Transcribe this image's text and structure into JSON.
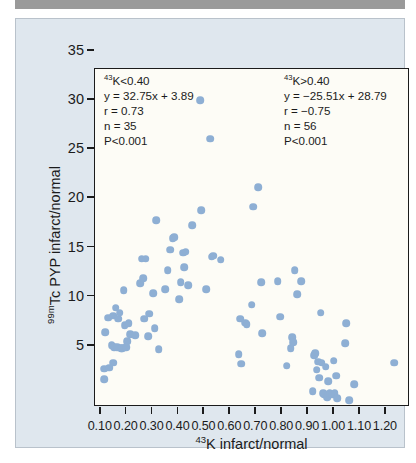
{
  "figure": {
    "background_color": "#dfe7ee",
    "plot_background_color": "#fdfcf6",
    "point_color": "#8eafd4",
    "axis_color": "#1b1b1b"
  },
  "annotations": {
    "left": {
      "header_sup": "43",
      "header_text": "K<0.40",
      "equation": "y = 32.75x + 3.89",
      "r": "r = 0.73",
      "n": "n = 35",
      "p": "P<0.001"
    },
    "right": {
      "header_sup": "43",
      "header_text": "K>0.40",
      "equation": "y = −25.51x + 28.79",
      "r": "r = −0.75",
      "n": "n = 56",
      "p": "P<0.001"
    }
  },
  "axes": {
    "x_title_sup": "43",
    "x_title_text": "K infarct/normal",
    "y_title_sup": "99m",
    "y_title_text": "Tc PYP infarct/normal"
  },
  "chart_data": {
    "type": "scatter",
    "title": "",
    "xlabel": "43K infarct/normal",
    "ylabel": "99mTc PYP infarct/normal",
    "xlim": [
      0.02,
      1.235
    ],
    "ylim": [
      0.6,
      35
    ],
    "xticks": [
      0.1,
      0.2,
      0.3,
      0.4,
      0.5,
      0.6,
      0.7,
      0.8,
      0.9,
      1.0,
      1.1,
      1.2
    ],
    "xticklabels": [
      "0.10",
      "0.20",
      "0.30",
      "0.40",
      "0.50",
      "0.60",
      "0.70",
      "0.80",
      "0.90",
      "1.00",
      "1.10",
      "1.20"
    ],
    "yticks": [
      5,
      10,
      15,
      20,
      25,
      30,
      35
    ],
    "yticklabels": [
      "5",
      "10",
      "15",
      "20",
      "25",
      "30",
      "35"
    ],
    "grid": false,
    "legend": "none",
    "regressions": [
      {
        "group": "43K<0.40",
        "slope": 32.75,
        "intercept": 3.89,
        "r": 0.73,
        "n": 35,
        "p": "<0.001"
      },
      {
        "group": "43K>0.40",
        "slope": -25.51,
        "intercept": 28.79,
        "r": -0.75,
        "n": 56,
        "p": "<0.001"
      }
    ],
    "points": [
      [
        0.055,
        3.4
      ],
      [
        0.055,
        4.5
      ],
      [
        0.06,
        8.2
      ],
      [
        0.07,
        9.7
      ],
      [
        0.075,
        4.6
      ],
      [
        0.085,
        6.9
      ],
      [
        0.09,
        9.9
      ],
      [
        0.09,
        5.1
      ],
      [
        0.095,
        6.7
      ],
      [
        0.1,
        10.7
      ],
      [
        0.105,
        6.7
      ],
      [
        0.11,
        9.6
      ],
      [
        0.115,
        10.2
      ],
      [
        0.12,
        6.6
      ],
      [
        0.125,
        6.6
      ],
      [
        0.13,
        12.5
      ],
      [
        0.135,
        8.9
      ],
      [
        0.14,
        6.7
      ],
      [
        0.145,
        7.3
      ],
      [
        0.15,
        9.1
      ],
      [
        0.155,
        8.0
      ],
      [
        0.175,
        7.9
      ],
      [
        0.195,
        13.2
      ],
      [
        0.2,
        15.7
      ],
      [
        0.205,
        13.7
      ],
      [
        0.21,
        9.6
      ],
      [
        0.215,
        15.7
      ],
      [
        0.225,
        7.8
      ],
      [
        0.23,
        10.1
      ],
      [
        0.245,
        12.2
      ],
      [
        0.25,
        8.6
      ],
      [
        0.255,
        19.6
      ],
      [
        0.265,
        6.5
      ],
      [
        0.29,
        12.6
      ],
      [
        0.3,
        14.5
      ],
      [
        0.31,
        16.6
      ],
      [
        0.32,
        17.8
      ],
      [
        0.325,
        17.9
      ],
      [
        0.345,
        11.6
      ],
      [
        0.35,
        13.3
      ],
      [
        0.36,
        16.3
      ],
      [
        0.365,
        14.8
      ],
      [
        0.37,
        16.4
      ],
      [
        0.38,
        13.0
      ],
      [
        0.395,
        19.1
      ],
      [
        0.425,
        31.8
      ],
      [
        0.43,
        20.6
      ],
      [
        0.45,
        12.6
      ],
      [
        0.465,
        27.9
      ],
      [
        0.47,
        15.9
      ],
      [
        0.475,
        16.0
      ],
      [
        0.505,
        15.6
      ],
      [
        0.575,
        6.0
      ],
      [
        0.58,
        9.6
      ],
      [
        0.585,
        5.0
      ],
      [
        0.6,
        9.2
      ],
      [
        0.605,
        9.0
      ],
      [
        0.625,
        11.0
      ],
      [
        0.63,
        21.0
      ],
      [
        0.65,
        23.0
      ],
      [
        0.66,
        13.3
      ],
      [
        0.665,
        8.1
      ],
      [
        0.725,
        13.4
      ],
      [
        0.735,
        9.8
      ],
      [
        0.76,
        4.8
      ],
      [
        0.775,
        6.6
      ],
      [
        0.78,
        7.7
      ],
      [
        0.785,
        7.2
      ],
      [
        0.79,
        14.5
      ],
      [
        0.8,
        12.1
      ],
      [
        0.815,
        13.4
      ],
      [
        0.86,
        2.2
      ],
      [
        0.865,
        5.9
      ],
      [
        0.87,
        6.1
      ],
      [
        0.875,
        4.4
      ],
      [
        0.88,
        5.2
      ],
      [
        0.885,
        3.6
      ],
      [
        0.89,
        10.2
      ],
      [
        0.895,
        5.1
      ],
      [
        0.9,
        2.0
      ],
      [
        0.905,
        1.9
      ],
      [
        0.91,
        4.7
      ],
      [
        0.915,
        1.6
      ],
      [
        0.92,
        3.2
      ],
      [
        0.925,
        2.0
      ],
      [
        0.935,
        1.9
      ],
      [
        0.94,
        5.3
      ],
      [
        0.945,
        2.0
      ],
      [
        0.95,
        3.8
      ],
      [
        0.955,
        1.5
      ],
      [
        0.985,
        7.1
      ],
      [
        0.99,
        9.1
      ],
      [
        1.0,
        1.3
      ],
      [
        1.02,
        2.9
      ],
      [
        1.175,
        5.1
      ]
    ]
  }
}
